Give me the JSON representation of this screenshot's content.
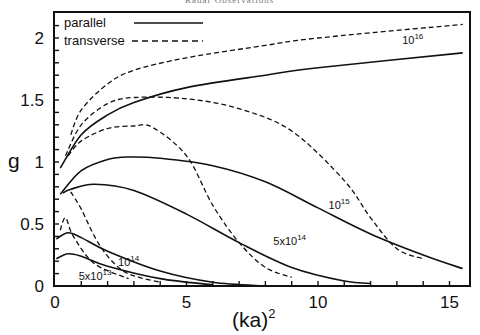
{
  "header": {
    "text": "Radar Observations"
  },
  "chart_data": {
    "type": "line",
    "title": "",
    "xlabel": "(ka)²",
    "ylabel": "g",
    "xlim": [
      0,
      16
    ],
    "ylim": [
      0,
      2.2
    ],
    "x_ticks": [
      0,
      5,
      10,
      15
    ],
    "x_tick_labels": [
      "0",
      "5",
      "10",
      "15"
    ],
    "y_ticks": [
      0,
      0.5,
      1,
      1.5,
      2
    ],
    "y_tick_labels": [
      "0",
      "0.5",
      "1",
      "1.5",
      "2"
    ],
    "grid": false,
    "legend": {
      "position": "upper-left",
      "entries": [
        {
          "label": "parallel",
          "style": "solid"
        },
        {
          "label": "transverse",
          "style": "dashed"
        }
      ]
    },
    "series": [
      {
        "name": "10^16 parallel",
        "style": "solid",
        "x": [
          0.2,
          1,
          2,
          3,
          5,
          8,
          10,
          15.5
        ],
        "y": [
          0.95,
          1.22,
          1.38,
          1.48,
          1.6,
          1.7,
          1.76,
          1.88
        ]
      },
      {
        "name": "10^16 transverse",
        "style": "dashed",
        "x": [
          0.6,
          1,
          2,
          3,
          5,
          8,
          10,
          15.5
        ],
        "y": [
          1.22,
          1.42,
          1.63,
          1.74,
          1.84,
          1.94,
          2.0,
          2.11
        ]
      },
      {
        "name": "10^15 parallel",
        "style": "solid",
        "x": [
          0.2,
          1,
          2,
          2.8,
          4,
          6,
          8,
          10,
          12,
          14,
          15.5
        ],
        "y": [
          0.74,
          0.93,
          1.02,
          1.04,
          1.03,
          0.97,
          0.84,
          0.63,
          0.42,
          0.25,
          0.14
        ]
      },
      {
        "name": "10^15 transverse",
        "style": "dashed",
        "x": [
          0.4,
          1,
          2,
          3,
          5,
          7,
          9,
          11,
          12,
          13,
          14
        ],
        "y": [
          1.05,
          1.3,
          1.47,
          1.52,
          1.51,
          1.43,
          1.25,
          0.85,
          0.55,
          0.3,
          0.22
        ]
      },
      {
        "name": "5x10^14 parallel",
        "style": "solid",
        "x": [
          0.3,
          0.6,
          1.5,
          3,
          5,
          7,
          9,
          11,
          12
        ],
        "y": [
          0.75,
          0.78,
          0.82,
          0.77,
          0.58,
          0.35,
          0.15,
          0.04,
          0.02
        ]
      },
      {
        "name": "5x10^14 transverse",
        "style": "dashed",
        "x": [
          0.5,
          1,
          2,
          3,
          3.7,
          5,
          6,
          7,
          8,
          9
        ],
        "y": [
          1.05,
          1.17,
          1.27,
          1.29,
          1.28,
          1.05,
          0.65,
          0.35,
          0.15,
          0.07
        ]
      },
      {
        "name": "10^14 parallel",
        "style": "solid",
        "x": [
          0.05,
          0.5,
          1,
          2,
          4,
          6,
          8
        ],
        "y": [
          0.38,
          0.43,
          0.39,
          0.28,
          0.12,
          0.03,
          0.0
        ]
      },
      {
        "name": "10^14 transverse",
        "style": "dashed",
        "x": [
          0.6,
          1,
          1.5,
          2,
          2.6,
          3.2,
          4
        ],
        "y": [
          0.76,
          0.62,
          0.4,
          0.24,
          0.12,
          0.07,
          0.03
        ]
      },
      {
        "name": "5x10^13 parallel",
        "style": "solid",
        "x": [
          0.05,
          0.5,
          1,
          2,
          4,
          6
        ],
        "y": [
          0.22,
          0.26,
          0.24,
          0.16,
          0.06,
          0.01
        ]
      },
      {
        "name": "5x10^13 transverse",
        "style": "dashed",
        "x": [
          0.2,
          0.4,
          0.7,
          1.5,
          2.8
        ],
        "y": [
          0.45,
          0.55,
          0.4,
          0.18,
          0.06
        ]
      }
    ],
    "annotations": [
      {
        "base": "10",
        "exp": "16",
        "x": 13.2,
        "y": 1.95
      },
      {
        "base": "10",
        "exp": "15",
        "x": 10.4,
        "y": 0.62
      },
      {
        "base": "5x10",
        "exp": "14",
        "x": 8.3,
        "y": 0.33
      },
      {
        "base": "10",
        "exp": "14",
        "x": 2.4,
        "y": 0.16
      },
      {
        "base": "5x10",
        "exp": "13",
        "x": 0.9,
        "y": 0.05
      }
    ]
  }
}
